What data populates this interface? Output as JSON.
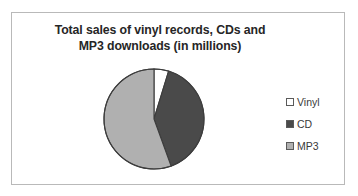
{
  "card": {
    "background": "#ffffff",
    "border_color": "#b9b9b9"
  },
  "chart_data": {
    "type": "pie",
    "title": "Total sales of vinyl records, CDs and MP3 downloads (in millions)",
    "title_lines": [
      "Total sales of vinyl records, CDs and",
      "MP3 downloads  (in millions)"
    ],
    "xlabel": "",
    "ylabel": "",
    "categories": [
      "Vinyl",
      "CD",
      "MP3"
    ],
    "values": [
      4.7,
      39.7,
      55.6
    ],
    "value_unit": "percent",
    "start_angle_deg": 0,
    "direction": "clockwise",
    "slices": [
      {
        "label": "Vinyl",
        "percent": 4.7,
        "angle_deg": 17,
        "color": "#ffffff"
      },
      {
        "label": "CD",
        "percent": 39.7,
        "angle_deg": 143,
        "color": "#4a4a4a"
      },
      {
        "label": "MP3",
        "percent": 55.6,
        "angle_deg": 200,
        "color": "#b0b0b0"
      }
    ],
    "slice_outline_color": "#3d3d3d",
    "legend_position": "right",
    "legend": [
      {
        "label": "Vinyl",
        "swatch_color": "#ffffff"
      },
      {
        "label": "CD",
        "swatch_color": "#4a4a4a"
      },
      {
        "label": "MP3",
        "swatch_color": "#b0b0b0"
      }
    ],
    "grid": false
  }
}
